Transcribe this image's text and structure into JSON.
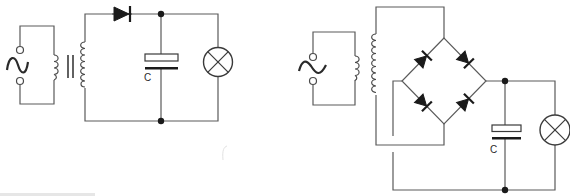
{
  "figure": {
    "left_circuit": {
      "name": "half-wave-rectifier",
      "components": [
        "ac-source",
        "transformer",
        "diode",
        "capacitor",
        "lamp"
      ],
      "capacitor_label": "C"
    },
    "right_circuit": {
      "name": "full-wave-bridge-rectifier",
      "components": [
        "ac-source",
        "transformer",
        "bridge-diode-1",
        "bridge-diode-2",
        "bridge-diode-3",
        "bridge-diode-4",
        "capacitor",
        "lamp"
      ],
      "capacitor_label": "C"
    },
    "colors": {
      "wire": "#5a5a5a",
      "symbol": "#1a1a1a",
      "background": "#ffffff"
    }
  }
}
